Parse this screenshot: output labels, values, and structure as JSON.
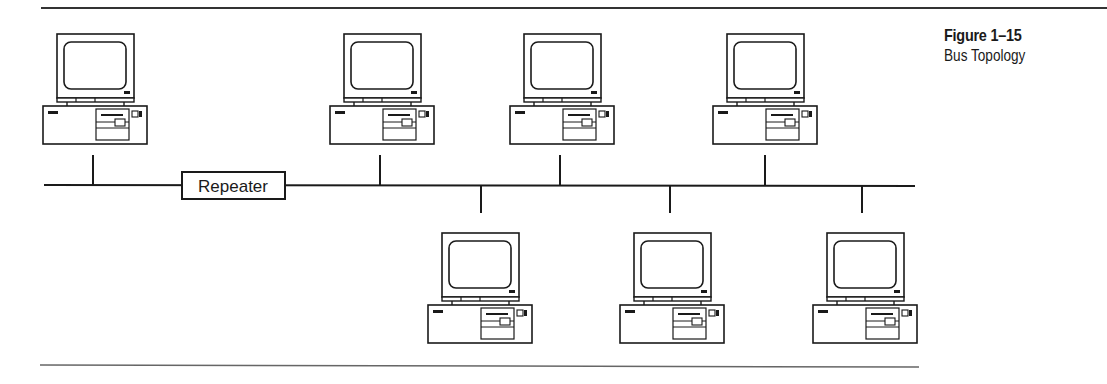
{
  "figure": {
    "number": "Figure 1–15",
    "title": "Bus Topology"
  },
  "diagram": {
    "type": "bus-topology",
    "bus_label_device": "Repeater",
    "colors": {
      "line": "#1a1a1a",
      "background": "#ffffff",
      "rule": "#333333"
    },
    "nodes_above_bus": [
      {
        "id": "pc-1",
        "x": 43,
        "drop_x": 93
      },
      {
        "id": "pc-2",
        "x": 330,
        "drop_x": 380
      },
      {
        "id": "pc-3",
        "x": 510,
        "drop_x": 560
      },
      {
        "id": "pc-4",
        "x": 713,
        "drop_x": 765
      }
    ],
    "nodes_below_bus": [
      {
        "id": "pc-5",
        "x": 428,
        "drop_x": 481
      },
      {
        "id": "pc-6",
        "x": 620,
        "drop_x": 670
      },
      {
        "id": "pc-7",
        "x": 813,
        "drop_x": 862
      }
    ]
  }
}
